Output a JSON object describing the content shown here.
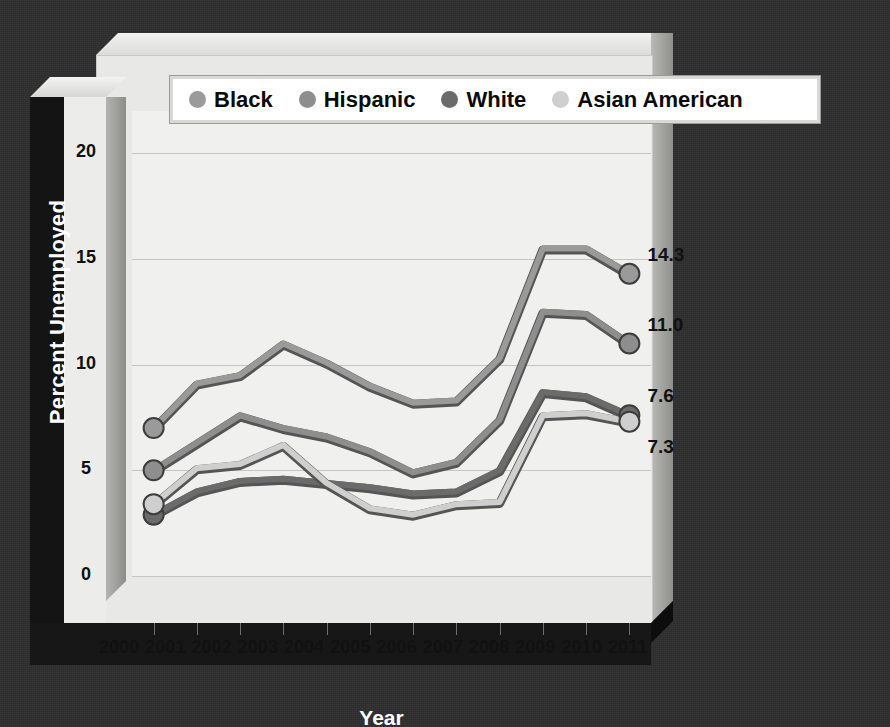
{
  "chart_data": {
    "type": "line",
    "title": "",
    "xlabel": "Year",
    "ylabel": "Percent Unemployed",
    "x": [
      2000,
      2001,
      2002,
      2003,
      2004,
      2005,
      2006,
      2007,
      2008,
      2009,
      2010,
      2011
    ],
    "categories": [
      "2000",
      "2001",
      "2002",
      "2003",
      "2004",
      "2005",
      "2006",
      "2007",
      "2008",
      "2009",
      "2010",
      "2011"
    ],
    "ylim": [
      0,
      22
    ],
    "yticks": [
      0,
      5,
      10,
      15,
      20
    ],
    "ytick_labels": [
      "0",
      "5",
      "10",
      "15",
      "20"
    ],
    "grid": true,
    "legend_position": "top",
    "series": [
      {
        "name": "Black",
        "color": "#9a9a9a",
        "values": [
          7.0,
          9.1,
          9.5,
          11.0,
          10.1,
          9.0,
          8.2,
          8.3,
          10.3,
          15.5,
          15.5,
          14.3
        ],
        "end_label": "14.3"
      },
      {
        "name": "Hispanic",
        "color": "#8e8e8e",
        "values": [
          5.0,
          6.3,
          7.6,
          7.0,
          6.6,
          5.9,
          4.9,
          5.4,
          7.4,
          12.5,
          12.4,
          11.0
        ],
        "end_label": "11.0"
      },
      {
        "name": "White",
        "color": "#6b6b6b",
        "values": [
          2.9,
          4.0,
          4.5,
          4.6,
          4.4,
          4.2,
          3.9,
          4.0,
          5.0,
          8.7,
          8.5,
          7.6
        ],
        "end_label": "7.6"
      },
      {
        "name": "Asian American",
        "color": "#cfcfcf",
        "values": [
          3.4,
          5.1,
          5.3,
          6.2,
          4.4,
          3.2,
          2.9,
          3.4,
          3.5,
          7.6,
          7.7,
          7.3
        ],
        "end_label": "7.3"
      }
    ]
  },
  "axes": {
    "y_title": "Percent Unemployed",
    "x_title": "Year",
    "y_tick_labels": [
      "20",
      "15",
      "10",
      "5",
      "0"
    ],
    "x_tick_labels": [
      "2000",
      "2001",
      "2002",
      "2003",
      "2004",
      "2005",
      "2006",
      "2007",
      "2008",
      "2009",
      "2010",
      "2011"
    ]
  },
  "legend": {
    "items": [
      {
        "label": "Black",
        "swatch": "#9a9a9a"
      },
      {
        "label": "Hispanic",
        "swatch": "#8e8e8e"
      },
      {
        "label": "White",
        "swatch": "#6b6b6b"
      },
      {
        "label": "Asian American",
        "swatch": "#cfcfcf"
      }
    ]
  },
  "end_labels": [
    {
      "text": "14.3"
    },
    {
      "text": "11.0"
    },
    {
      "text": "7.6"
    },
    {
      "text": "7.3"
    }
  ],
  "colors": {
    "plot_background": "#f0f0ee",
    "slab_face": "#e8e8e6",
    "outer_background": "#2e2e2e",
    "pillar_black": "#141414",
    "gridline": "#c4c4c2",
    "text_dark": "#111111",
    "text_light": "#ffffff"
  }
}
